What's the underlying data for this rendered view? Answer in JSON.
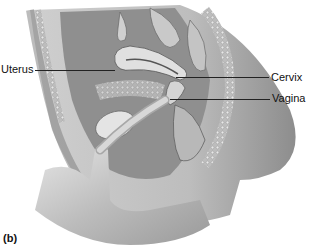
{
  "figure": {
    "panel_label": "(b)",
    "labels": [
      {
        "text": "Uterus",
        "side": "left"
      },
      {
        "text": "Cervix",
        "side": "right"
      },
      {
        "text": "Vagina",
        "side": "right"
      }
    ]
  },
  "colors": {
    "background": "#ffffff",
    "tissue_light": "#d9d9d9",
    "tissue_mid": "#a6a6a6",
    "tissue_dark": "#5e5e5e",
    "text": "#111111"
  }
}
